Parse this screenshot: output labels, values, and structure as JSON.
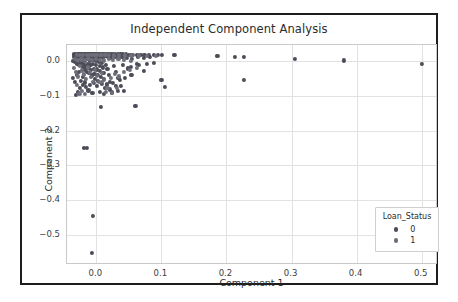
{
  "chart_data": {
    "type": "scatter",
    "title": "Independent Component Analysis",
    "xlabel": "Component 1",
    "ylabel": "Component 2",
    "xlim": [
      -0.045,
      0.525
    ],
    "ylim": [
      -0.585,
      0.045
    ],
    "xticks": [
      "0.0",
      "0.1",
      "0.2",
      "0.3",
      "0.4",
      "0.5"
    ],
    "xtick_values": [
      0.0,
      0.1,
      0.2,
      0.3,
      0.4,
      0.5
    ],
    "yticks": [
      "0.0",
      "−0.1",
      "−0.2",
      "−0.3",
      "−0.4",
      "−0.5"
    ],
    "ytick_values": [
      0.0,
      -0.1,
      -0.2,
      -0.3,
      -0.4,
      -0.5
    ],
    "grid": true,
    "legend": {
      "title": "Loan_Status",
      "position": "lower right",
      "entries": [
        {
          "label": "0",
          "color": "#4c4c58"
        },
        {
          "label": "1",
          "color": "#6e6e7a"
        }
      ]
    },
    "series": [
      {
        "name": "0",
        "color": "#4c4c58",
        "points": [
          [
            -0.034,
            0.018
          ],
          [
            -0.031,
            0.018
          ],
          [
            -0.028,
            0.018
          ],
          [
            -0.026,
            0.018
          ],
          [
            -0.024,
            0.018
          ],
          [
            -0.022,
            0.018
          ],
          [
            -0.02,
            0.018
          ],
          [
            -0.018,
            0.018
          ],
          [
            -0.016,
            0.018
          ],
          [
            -0.014,
            0.018
          ],
          [
            -0.012,
            0.018
          ],
          [
            -0.01,
            0.018
          ],
          [
            -0.008,
            0.018
          ],
          [
            -0.006,
            0.018
          ],
          [
            -0.004,
            0.018
          ],
          [
            -0.002,
            0.018
          ],
          [
            0.0,
            0.018
          ],
          [
            0.002,
            0.018
          ],
          [
            0.004,
            0.018
          ],
          [
            0.006,
            0.018
          ],
          [
            0.008,
            0.018
          ],
          [
            0.01,
            0.018
          ],
          [
            0.013,
            0.018
          ],
          [
            0.016,
            0.018
          ],
          [
            0.019,
            0.018
          ],
          [
            0.022,
            0.018
          ],
          [
            0.025,
            0.018
          ],
          [
            0.029,
            0.018
          ],
          [
            0.033,
            0.018
          ],
          [
            0.037,
            0.018
          ],
          [
            0.041,
            0.018
          ],
          [
            0.046,
            0.018
          ],
          [
            0.051,
            0.017
          ],
          [
            0.056,
            0.017
          ],
          [
            0.062,
            0.017
          ],
          [
            0.068,
            0.017
          ],
          [
            0.074,
            0.017
          ],
          [
            0.081,
            0.017
          ],
          [
            0.088,
            0.017
          ],
          [
            0.095,
            0.017
          ],
          [
            0.101,
            0.017
          ],
          [
            0.12,
            0.016
          ],
          [
            0.186,
            0.013
          ],
          [
            0.213,
            0.012
          ],
          [
            0.227,
            0.011
          ],
          [
            0.305,
            0.005
          ],
          [
            0.381,
            0.001
          ],
          [
            0.5,
            -0.008
          ],
          [
            -0.036,
            0.0
          ],
          [
            -0.033,
            -0.003
          ],
          [
            -0.03,
            0.005
          ],
          [
            -0.029,
            -0.008
          ],
          [
            -0.027,
            0.002
          ],
          [
            -0.026,
            -0.013
          ],
          [
            -0.024,
            0.008
          ],
          [
            -0.023,
            -0.005
          ],
          [
            -0.021,
            -0.018
          ],
          [
            -0.02,
            0.004
          ],
          [
            -0.019,
            -0.01
          ],
          [
            -0.018,
            -0.025
          ],
          [
            -0.017,
            0.001
          ],
          [
            -0.016,
            -0.014
          ],
          [
            -0.015,
            -0.031
          ],
          [
            -0.014,
            0.006
          ],
          [
            -0.013,
            -0.008
          ],
          [
            -0.012,
            -0.021
          ],
          [
            -0.011,
            -0.036
          ],
          [
            -0.01,
            0.0
          ],
          [
            -0.009,
            -0.012
          ],
          [
            -0.008,
            -0.027
          ],
          [
            -0.007,
            -0.042
          ],
          [
            -0.006,
            0.003
          ],
          [
            -0.005,
            -0.009
          ],
          [
            -0.004,
            -0.023
          ],
          [
            -0.003,
            -0.038
          ],
          [
            -0.002,
            -0.052
          ],
          [
            -0.001,
            0.001
          ],
          [
            0.0,
            -0.011
          ],
          [
            0.001,
            -0.025
          ],
          [
            0.002,
            -0.04
          ],
          [
            0.003,
            -0.058
          ],
          [
            0.004,
            -0.004
          ],
          [
            0.005,
            -0.016
          ],
          [
            0.006,
            -0.03
          ],
          [
            0.007,
            -0.046
          ],
          [
            0.008,
            -0.066
          ],
          [
            0.009,
            -0.007
          ],
          [
            0.01,
            -0.019
          ],
          [
            0.011,
            -0.034
          ],
          [
            0.012,
            -0.052
          ],
          [
            0.013,
            -0.078
          ],
          [
            0.015,
            -0.011
          ],
          [
            0.017,
            -0.024
          ],
          [
            0.019,
            -0.04
          ],
          [
            0.021,
            -0.061
          ],
          [
            0.024,
            -0.091
          ],
          [
            0.027,
            -0.016
          ],
          [
            0.03,
            -0.032
          ],
          [
            0.034,
            -0.05
          ],
          [
            0.038,
            -0.072
          ],
          [
            0.043,
            -0.086
          ],
          [
            0.048,
            -0.022
          ],
          [
            0.054,
            -0.041
          ],
          [
            0.06,
            -0.129
          ],
          [
            0.066,
            -0.011
          ],
          [
            0.073,
            -0.029
          ],
          [
            0.007,
            -0.133
          ],
          [
            0.1,
            -0.055
          ],
          [
            0.105,
            -0.074
          ],
          [
            0.227,
            -0.056
          ],
          [
            -0.019,
            -0.25
          ],
          [
            -0.014,
            -0.249
          ],
          [
            -0.005,
            -0.445
          ],
          [
            -0.007,
            -0.551
          ],
          [
            -0.031,
            -0.099
          ],
          [
            -0.028,
            -0.089
          ],
          [
            -0.025,
            -0.079
          ],
          [
            -0.021,
            -0.069
          ],
          [
            -0.033,
            -0.06
          ],
          [
            -0.036,
            -0.049
          ],
          [
            -0.03,
            -0.04
          ],
          [
            -0.027,
            -0.033
          ],
          [
            -0.012,
            -0.085
          ],
          [
            -0.016,
            -0.074
          ],
          [
            -0.006,
            -0.092
          ],
          [
            0.021,
            -0.082
          ],
          [
            0.033,
            -0.086
          ],
          [
            0.041,
            -0.013
          ],
          [
            0.053,
            -0.018
          ],
          [
            0.063,
            -0.01
          ],
          [
            0.078,
            -0.008
          ],
          [
            0.088,
            -0.006
          ],
          [
            -0.024,
            -0.057
          ],
          [
            -0.02,
            -0.046
          ],
          [
            -0.018,
            -0.062
          ],
          [
            -0.01,
            -0.07
          ],
          [
            -0.004,
            -0.064
          ],
          [
            0.001,
            -0.073
          ],
          [
            0.006,
            -0.089
          ],
          [
            0.012,
            -0.095
          ],
          [
            0.016,
            -0.068
          ],
          [
            0.026,
            -0.064
          ],
          [
            0.03,
            -0.072
          ],
          [
            0.036,
            -0.056
          ],
          [
            0.044,
            -0.049
          ],
          [
            -0.035,
            0.012
          ],
          [
            -0.032,
            0.009
          ],
          [
            -0.029,
            0.013
          ],
          [
            -0.026,
            0.01
          ],
          [
            -0.023,
            0.014
          ],
          [
            -0.021,
            0.011
          ],
          [
            -0.018,
            0.015
          ],
          [
            -0.015,
            0.012
          ],
          [
            -0.012,
            0.009
          ],
          [
            -0.009,
            0.013
          ],
          [
            -0.006,
            0.01
          ],
          [
            -0.003,
            0.014
          ],
          [
            0.0,
            0.011
          ],
          [
            0.003,
            0.008
          ],
          [
            0.006,
            0.012
          ],
          [
            0.01,
            0.009
          ],
          [
            0.014,
            0.013
          ],
          [
            0.018,
            0.01
          ],
          [
            0.023,
            0.007
          ],
          [
            0.028,
            0.011
          ],
          [
            0.034,
            0.008
          ],
          [
            0.04,
            0.012
          ],
          [
            0.047,
            0.009
          ],
          [
            0.055,
            0.006
          ],
          [
            0.064,
            0.01
          ],
          [
            0.073,
            0.007
          ],
          [
            0.083,
            0.011
          ]
        ]
      },
      {
        "name": "1",
        "color": "#6e6e7a",
        "points": [
          [
            -0.03,
            0.016
          ],
          [
            -0.025,
            0.016
          ],
          [
            -0.02,
            0.016
          ],
          [
            -0.015,
            0.016
          ],
          [
            -0.011,
            0.016
          ],
          [
            -0.007,
            0.016
          ],
          [
            -0.003,
            0.016
          ],
          [
            0.001,
            0.016
          ],
          [
            0.005,
            0.016
          ],
          [
            0.009,
            0.016
          ],
          [
            0.014,
            0.016
          ],
          [
            0.02,
            0.016
          ],
          [
            0.027,
            0.015
          ],
          [
            0.035,
            0.015
          ],
          [
            0.044,
            0.015
          ],
          [
            0.054,
            0.015
          ],
          [
            0.065,
            0.015
          ],
          [
            0.078,
            0.014
          ],
          [
            0.092,
            0.014
          ],
          [
            -0.034,
            -0.02
          ],
          [
            -0.031,
            -0.032
          ],
          [
            -0.028,
            -0.045
          ],
          [
            -0.025,
            -0.015
          ],
          [
            -0.022,
            -0.028
          ],
          [
            -0.019,
            -0.039
          ],
          [
            -0.016,
            -0.052
          ],
          [
            -0.013,
            -0.019
          ],
          [
            -0.01,
            -0.033
          ],
          [
            -0.008,
            -0.047
          ],
          [
            -0.005,
            -0.06
          ],
          [
            -0.002,
            -0.026
          ],
          [
            0.001,
            -0.043
          ],
          [
            0.004,
            -0.061
          ],
          [
            0.008,
            -0.036
          ],
          [
            0.012,
            -0.055
          ],
          [
            0.017,
            -0.078
          ],
          [
            0.022,
            -0.049
          ],
          [
            0.028,
            -0.038
          ],
          [
            0.035,
            -0.045
          ],
          [
            0.043,
            -0.033
          ],
          [
            0.052,
            -0.026
          ],
          [
            0.062,
            -0.021
          ],
          [
            -0.03,
            -0.07
          ],
          [
            -0.026,
            -0.095
          ],
          [
            -0.022,
            -0.086
          ],
          [
            -0.017,
            -0.096
          ],
          [
            0.009,
            -0.061
          ],
          [
            0.015,
            -0.089
          ],
          [
            0.024,
            -0.093
          ],
          [
            0.032,
            -0.079
          ],
          [
            -0.033,
            0.006
          ],
          [
            -0.028,
            0.002
          ],
          [
            -0.023,
            0.004
          ],
          [
            -0.017,
            0.001
          ],
          [
            -0.012,
            0.005
          ],
          [
            -0.007,
            0.002
          ],
          [
            -0.001,
            0.006
          ],
          [
            0.005,
            0.003
          ],
          [
            0.012,
            0.001
          ],
          [
            0.019,
            0.005
          ],
          [
            0.026,
            0.002
          ],
          [
            0.034,
            0.006
          ],
          [
            0.043,
            0.003
          ],
          [
            0.053,
            0.0
          ]
        ]
      }
    ]
  }
}
